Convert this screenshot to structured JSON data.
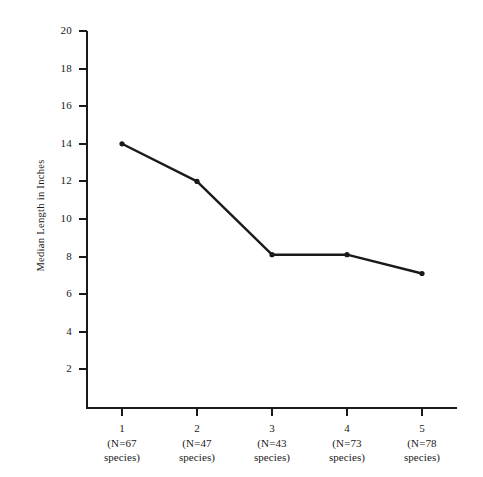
{
  "chart_data": {
    "type": "line",
    "title": "",
    "subtitle": "",
    "xlabel": "",
    "ylabel": "Median Length in Inches",
    "categories": [
      "1",
      "2",
      "3",
      "4",
      "5"
    ],
    "category_sublabels": [
      [
        "(N=67",
        "species)"
      ],
      [
        "(N=47",
        "species)"
      ],
      [
        "(N=43",
        "species)"
      ],
      [
        "(N=73",
        "species)"
      ],
      [
        "(N=78",
        "species)"
      ]
    ],
    "sample_sizes": [
      67,
      47,
      43,
      73,
      78
    ],
    "values": [
      14.0,
      12.0,
      8.1,
      8.1,
      7.1
    ],
    "series": [
      {
        "name": "Median Length in Inches",
        "values": [
          14.0,
          12.0,
          8.1,
          8.1,
          7.1
        ]
      }
    ],
    "ylim": [
      0,
      20
    ],
    "xlim": [
      0.5,
      5.5
    ],
    "ytick_labels": [
      "2",
      "4",
      "6",
      "8",
      "10",
      "12",
      "14",
      "16",
      "18",
      "20"
    ],
    "ytick_values": [
      2,
      4,
      6,
      8,
      10,
      12,
      14,
      16,
      18,
      20
    ],
    "ytick_interval": 2,
    "grid": false,
    "legend": false,
    "legend_position": "none",
    "marker": "circle",
    "line_color": "#1a1a1a",
    "marker_color": "#1a1a1a",
    "background_color": "#ffffff",
    "annotations": []
  }
}
